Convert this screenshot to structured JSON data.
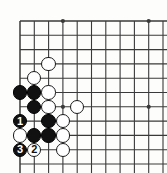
{
  "figure": {
    "type": "go-board-diagram",
    "title": "",
    "board_corner": "bottom-left",
    "colors": {
      "line": "#3a3a3a",
      "board_background": "#fdfdfb",
      "black_stone": "#111111",
      "white_stone": "#ffffff",
      "stone_outline": "#1a1a1a",
      "black_numeral": "#ffffff",
      "white_numeral": "#111111"
    }
  },
  "grid": {
    "origin_x": 20,
    "origin_y": 21,
    "spacing": 14.3,
    "cols": 11,
    "rows": 11,
    "stone_radius": 7.2,
    "star_points": [
      {
        "col": 3,
        "row": 0
      },
      {
        "col": 9,
        "row": 0
      },
      {
        "col": 3,
        "row": 6
      },
      {
        "col": 9,
        "row": 6
      }
    ]
  },
  "stones": [
    {
      "col": 2,
      "row": 3,
      "color": "white",
      "label": ""
    },
    {
      "col": 1,
      "row": 4,
      "color": "white",
      "label": ""
    },
    {
      "col": 0,
      "row": 5,
      "color": "black",
      "label": ""
    },
    {
      "col": 1,
      "row": 5,
      "color": "black",
      "label": ""
    },
    {
      "col": 2,
      "row": 5,
      "color": "white",
      "label": ""
    },
    {
      "col": 1,
      "row": 6,
      "color": "black",
      "label": ""
    },
    {
      "col": 2,
      "row": 6,
      "color": "white",
      "label": ""
    },
    {
      "col": 4,
      "row": 6,
      "color": "white",
      "label": ""
    },
    {
      "col": 0,
      "row": 7,
      "color": "black",
      "label": "1"
    },
    {
      "col": 2,
      "row": 7,
      "color": "black",
      "label": ""
    },
    {
      "col": 3,
      "row": 7,
      "color": "white",
      "label": ""
    },
    {
      "col": 0,
      "row": 8,
      "color": "white",
      "label": ""
    },
    {
      "col": 1,
      "row": 8,
      "color": "black",
      "label": ""
    },
    {
      "col": 2,
      "row": 8,
      "color": "black",
      "label": ""
    },
    {
      "col": 3,
      "row": 8,
      "color": "white",
      "label": ""
    },
    {
      "col": 0,
      "row": 9,
      "color": "black",
      "label": "3"
    },
    {
      "col": 1,
      "row": 9,
      "color": "white",
      "label": "2"
    },
    {
      "col": 3,
      "row": 9,
      "color": "white",
      "label": ""
    }
  ],
  "move_sequence": [
    {
      "number": "1",
      "color": "black",
      "col": 0,
      "row": 7
    },
    {
      "number": "2",
      "color": "white",
      "col": 1,
      "row": 9
    },
    {
      "number": "3",
      "color": "black",
      "col": 0,
      "row": 9
    }
  ]
}
